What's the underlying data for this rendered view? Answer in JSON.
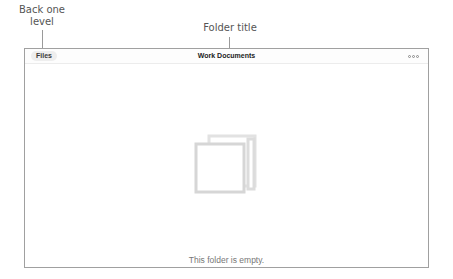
{
  "callouts": {
    "back": "Back one level",
    "title": "Folder title"
  },
  "navbar": {
    "back_label": "Files",
    "title": "Work Documents",
    "more_icon": "more-options-icon"
  },
  "content": {
    "empty_icon": "empty-folder-icon",
    "empty_message": "This folder is empty."
  }
}
